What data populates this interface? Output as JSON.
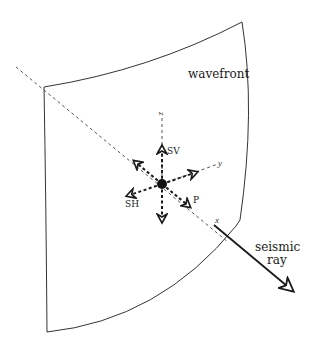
{
  "diagram": {
    "labels": {
      "wavefront": "wavefront",
      "ray_line1": "seismic",
      "ray_line2": "ray",
      "axis_x": "x",
      "axis_y": "y",
      "axis_z": "z",
      "sv": "SV",
      "sh": "SH",
      "p": "P"
    },
    "colors": {
      "stroke": "#1a1a1a",
      "dashed": "#555555",
      "background": "#ffffff"
    }
  }
}
